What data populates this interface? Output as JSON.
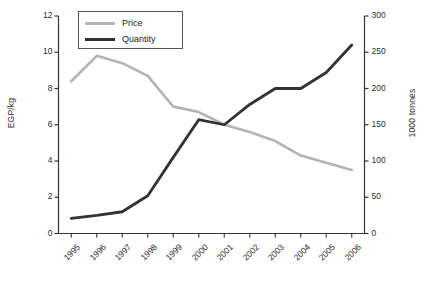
{
  "chart_data": {
    "type": "line",
    "title": "",
    "xlabel": "",
    "categories": [
      "1995",
      "1996",
      "1997",
      "1998",
      "1999",
      "2000",
      "2001",
      "2002",
      "2003",
      "2004",
      "2005",
      "2006"
    ],
    "grid": false,
    "legend_position": "top-left",
    "series": [
      {
        "name": "Price",
        "axis": "left",
        "ylabel": "EGP/kg",
        "ylim": [
          0,
          12
        ],
        "yticks": [
          0,
          2,
          4,
          6,
          8,
          10,
          12
        ],
        "color": "#b3b3b3",
        "values": [
          8.4,
          9.8,
          9.4,
          8.7,
          7.0,
          6.7,
          6.0,
          5.6,
          5.1,
          4.3,
          3.9,
          3.5
        ]
      },
      {
        "name": "Quantity",
        "axis": "right",
        "ylabel": "1000 tonnes",
        "ylim": [
          0,
          300
        ],
        "yticks": [
          0,
          50,
          100,
          150,
          200,
          250,
          300
        ],
        "color": "#333333",
        "values": [
          21,
          25,
          30,
          52,
          105,
          157,
          150,
          178,
          200,
          200,
          222,
          260
        ]
      }
    ]
  },
  "legend": {
    "price_label": "Price",
    "quantity_label": "Quantity"
  },
  "axes": {
    "left_title": "EGP/kg",
    "right_title": "1000 tonnes",
    "left_ticks": [
      "12",
      "10",
      "8",
      "6",
      "4",
      "2",
      "0"
    ],
    "right_ticks": [
      "300",
      "250",
      "200",
      "150",
      "100",
      "50",
      "0"
    ],
    "x_ticks": [
      "1995",
      "1996",
      "1997",
      "1998",
      "1999",
      "2000",
      "2001",
      "2002",
      "2003",
      "2004",
      "2005",
      "2006"
    ]
  }
}
